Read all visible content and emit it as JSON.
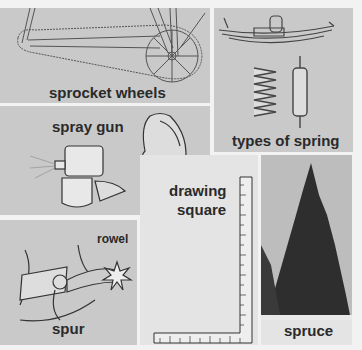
{
  "page": {
    "background": "#f2f2f2",
    "panels": [
      {
        "id": "sprocket",
        "label": "sprocket wheels",
        "background": "#c9c9c9"
      },
      {
        "id": "spring",
        "label": "types of spring",
        "background": "#c9c9c9"
      },
      {
        "id": "spraygun",
        "label": "spray gun",
        "background": "#c9c9c9"
      },
      {
        "id": "spur",
        "label": "spur",
        "sublabel": "rowel",
        "background": "#c9c9c9"
      },
      {
        "id": "square",
        "label_line1": "drawing",
        "label_line2": "square",
        "background": "#e4e4e4"
      },
      {
        "id": "spruce",
        "label": "spruce",
        "background": "#e4e4e4"
      }
    ]
  }
}
